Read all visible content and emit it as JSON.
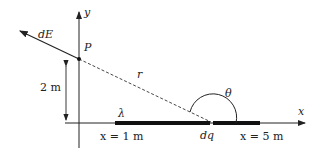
{
  "diagram": {
    "labels": {
      "field": "dE",
      "point": "P",
      "distance": "r",
      "height": "2 m",
      "charge_density": "λ",
      "angle": "θ",
      "element": "dq",
      "start": "x = 1 m",
      "end": "x = 5 m",
      "x_axis": "x",
      "y_axis": "y"
    },
    "geometry": {
      "point_P_m": [
        0,
        2
      ],
      "rod_from_m": 1,
      "rod_to_m": 5
    }
  }
}
